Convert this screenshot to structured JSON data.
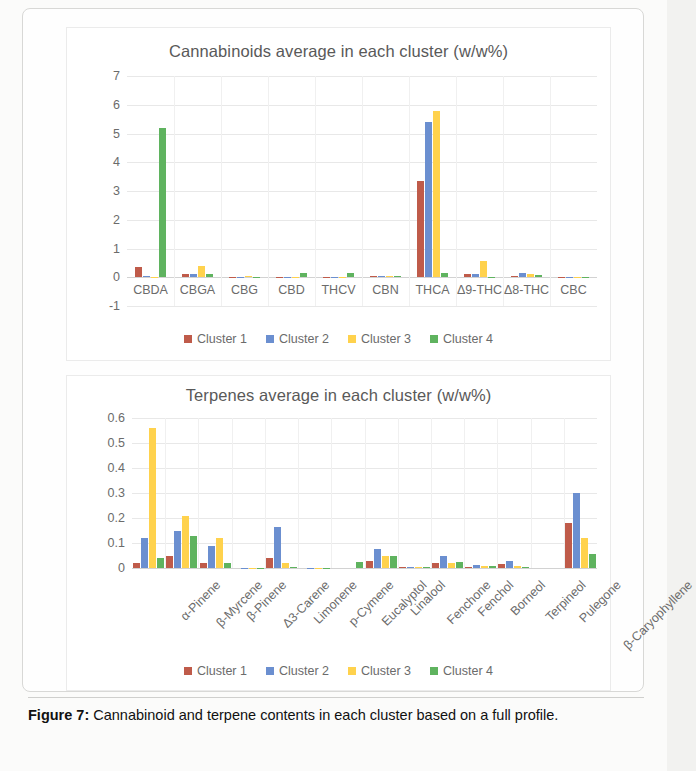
{
  "figure": {
    "caption_label": "Figure 7:",
    "caption_text": " Cannabinoid and terpene contents in each cluster based on a full profile."
  },
  "colors": {
    "cluster1": "#bf5b4a",
    "cluster2": "#6b8fd0",
    "cluster3": "#ffd24d",
    "cluster4": "#5fb35f"
  },
  "legend": {
    "items": [
      {
        "label": "Cluster 1",
        "color": "#bf5b4a"
      },
      {
        "label": "Cluster 2",
        "color": "#6b8fd0"
      },
      {
        "label": "Cluster 3",
        "color": "#ffd24d"
      },
      {
        "label": "Cluster 4",
        "color": "#5fb35f"
      }
    ]
  },
  "chart_data": [
    {
      "type": "bar",
      "title": "Cannabinoids average in each cluster (w/w%)",
      "xlabel": "",
      "ylabel": "",
      "ylim": [
        -1,
        7
      ],
      "yticks": [
        7,
        6,
        5,
        4,
        3,
        2,
        1,
        0,
        -1
      ],
      "grid": true,
      "legend_position": "bottom",
      "categories": [
        "CBDA",
        "CBGA",
        "CBG",
        "CBD",
        "THCV",
        "CBN",
        "THCA",
        "Δ9-THC",
        "Δ8-THC",
        "CBC"
      ],
      "series": [
        {
          "name": "Cluster 1",
          "color": "#bf5b4a",
          "values": [
            0.35,
            0.1,
            0.02,
            0.01,
            0.01,
            0.04,
            3.35,
            0.13,
            0.05,
            0.01
          ]
        },
        {
          "name": "Cluster 2",
          "color": "#6b8fd0",
          "values": [
            0.03,
            0.13,
            0.02,
            0.01,
            0.01,
            0.05,
            5.4,
            0.1,
            0.15,
            0.01
          ]
        },
        {
          "name": "Cluster 3",
          "color": "#ffd24d",
          "values": [
            0.02,
            0.4,
            0.03,
            0.01,
            0.01,
            0.03,
            5.8,
            0.55,
            0.12,
            0.02
          ]
        },
        {
          "name": "Cluster 4",
          "color": "#5fb35f",
          "values": [
            5.2,
            0.13,
            0.02,
            0.16,
            0.15,
            0.06,
            0.15,
            0.02,
            0.08,
            0.02
          ]
        }
      ]
    },
    {
      "type": "bar",
      "title": "Terpenes average in each cluster (w/w%)",
      "xlabel": "",
      "ylabel": "",
      "ylim": [
        0,
        0.6
      ],
      "yticks": [
        0.6,
        0.5,
        0.4,
        0.3,
        0.2,
        0.1,
        0
      ],
      "ytick_labels": [
        "0.6",
        "0.5",
        "0.4",
        "0.3",
        "0.2",
        "0.1",
        "0"
      ],
      "grid": true,
      "legend_position": "bottom",
      "categories": [
        "α-Pinene",
        "β-Myrcene",
        "β-Pinene",
        "Δ3-Carene",
        "Limonene",
        "p-Cymene",
        "Eucalyptol",
        "Linalool",
        "Fenchone",
        "Fenchol",
        "Borneol",
        "Terpineol",
        "Pulegone",
        "β-Caryophyllene"
      ],
      "series": [
        {
          "name": "Cluster 1",
          "color": "#bf5b4a",
          "values": [
            0.02,
            0.05,
            0.02,
            0.0,
            0.04,
            0.0,
            0.0,
            0.03,
            0.004,
            0.02,
            0.006,
            0.015,
            0.0,
            0.18
          ]
        },
        {
          "name": "Cluster 2",
          "color": "#6b8fd0",
          "values": [
            0.12,
            0.15,
            0.09,
            0.002,
            0.165,
            0.002,
            0.0,
            0.075,
            0.005,
            0.05,
            0.012,
            0.03,
            0.0,
            0.3
          ]
        },
        {
          "name": "Cluster 3",
          "color": "#ffd24d",
          "values": [
            0.56,
            0.21,
            0.12,
            0.002,
            0.02,
            0.002,
            0.0,
            0.05,
            0.003,
            0.022,
            0.008,
            0.008,
            0.0,
            0.12
          ]
        },
        {
          "name": "Cluster 4",
          "color": "#5fb35f",
          "values": [
            0.04,
            0.13,
            0.02,
            0.002,
            0.006,
            0.002,
            0.025,
            0.05,
            0.003,
            0.025,
            0.01,
            0.006,
            0.0,
            0.055
          ]
        }
      ]
    }
  ]
}
